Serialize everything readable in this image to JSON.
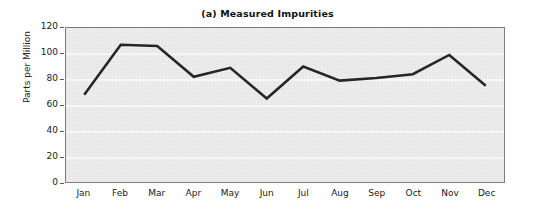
{
  "chart_data": {
    "type": "line",
    "title": "(a) Measured Impurities",
    "xlabel": "",
    "ylabel": "Parts per Million",
    "categories": [
      "Jan",
      "Feb",
      "Mar",
      "Apr",
      "May",
      "Jun",
      "Jul",
      "Aug",
      "Sep",
      "Oct",
      "Nov",
      "Dec"
    ],
    "series": [
      {
        "name": "Measured Impurities",
        "values": [
          68,
          107,
          106,
          82,
          89,
          65,
          90,
          79,
          81,
          84,
          99,
          75
        ]
      }
    ],
    "ylim": [
      0,
      120
    ],
    "yticks": [
      0,
      20,
      40,
      60,
      80,
      100,
      120
    ],
    "ytick_labels": [
      "0",
      "20",
      "40",
      "60",
      "80",
      "100",
      "120"
    ],
    "grid": true,
    "grid_axis": "y",
    "legend": false,
    "legend_position": "none",
    "line_color": "#262626",
    "line_width": 2.6,
    "panel_background": "#e9e9e9",
    "gridline_color": "#f8f8f8",
    "frame_color": "#7d7d7d",
    "text_color": "#1a1a1a"
  }
}
